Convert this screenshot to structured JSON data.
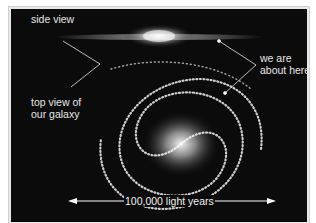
{
  "diagram": {
    "labels": {
      "side_view": "side view",
      "top_view_line1": "top view of",
      "top_view_line2": "our galaxy",
      "we_are_line1": "we are",
      "we_are_line2": "about here",
      "scale": "100,000 light years"
    },
    "colors": {
      "background": "#0b0b0b",
      "stars": "#ffffff",
      "text": "#e6e6e6"
    }
  }
}
